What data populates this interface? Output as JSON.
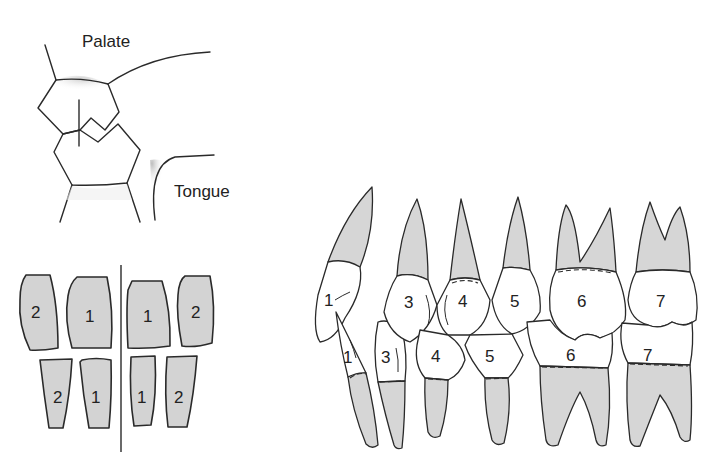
{
  "cross_section": {
    "labels": {
      "palate": "Palate",
      "tongue": "Tongue"
    }
  },
  "incisor_grid": {
    "upper": [
      "2",
      "1",
      "1",
      "2"
    ],
    "lower": [
      "2",
      "1",
      "1",
      "2"
    ]
  },
  "lateral_dentition": {
    "upper": [
      "1",
      "3",
      "4",
      "5",
      "6",
      "7"
    ],
    "lower": [
      "1",
      "3",
      "4",
      "5",
      "6",
      "7"
    ]
  },
  "colors": {
    "root_fill": "#d6d6d6",
    "crown_fill": "#ffffff",
    "outline": "#2a2a2a"
  }
}
